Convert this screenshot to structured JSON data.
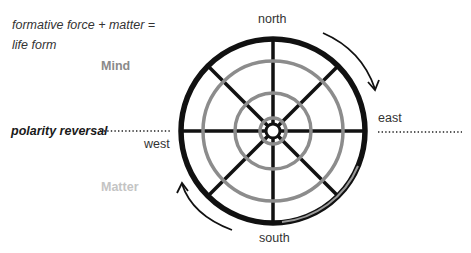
{
  "formula": {
    "line1": "formative force + matter =",
    "line2": "life form"
  },
  "labels": {
    "mind": "Mind",
    "matter": "Matter",
    "polarity_reversal": "polarity reversal"
  },
  "directions": {
    "north": "north",
    "south": "south",
    "east": "east",
    "west": "west"
  },
  "colors": {
    "outer_ring": "#111111",
    "inner_rings": "#8c8c8c",
    "mind_text": "#8a8a8a",
    "matter_text": "#c4c4c4"
  },
  "wheel": {
    "center": [
      273,
      131
    ],
    "outer_radius": 92,
    "ring_radii": [
      70,
      38,
      13
    ],
    "spokes": 8
  }
}
